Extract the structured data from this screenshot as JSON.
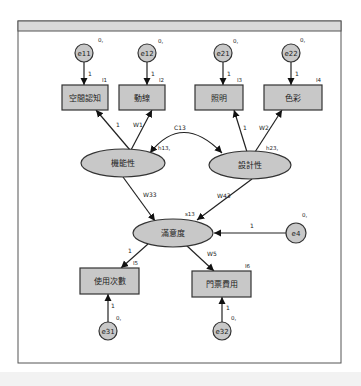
{
  "diagram": {
    "type": "structural-equation-model-path-diagram",
    "frame": {
      "x": 18,
      "y": 21,
      "w": 323,
      "h": 342,
      "header_h": 10,
      "header_color": "#d9d9d9"
    },
    "colors": {
      "node_fill": "#c8c8c8",
      "stroke": "#333333",
      "text": "#222222",
      "background": "#ffffff"
    },
    "observed": [
      {
        "id": "I1",
        "label": "空間認知",
        "tag": "I1",
        "x": 62,
        "y": 85,
        "w": 46,
        "h": 25
      },
      {
        "id": "I2",
        "label": "動線",
        "tag": "I2",
        "x": 119,
        "y": 85,
        "w": 46,
        "h": 25
      },
      {
        "id": "I3",
        "label": "照明",
        "tag": "I3",
        "x": 195,
        "y": 85,
        "w": 48,
        "h": 25
      },
      {
        "id": "I4",
        "label": "色彩",
        "tag": "I4",
        "x": 264,
        "y": 85,
        "w": 58,
        "h": 25
      },
      {
        "id": "I5",
        "label": "使用次數",
        "tag": "I5",
        "x": 80,
        "y": 268,
        "w": 59,
        "h": 26
      },
      {
        "id": "I6",
        "label": "門票費用",
        "tag": "I6",
        "x": 192,
        "y": 271,
        "w": 59,
        "h": 26
      }
    ],
    "latent": [
      {
        "id": "F1",
        "label": "機能性",
        "cx": 123,
        "cy": 163,
        "rx": 42,
        "ry": 14,
        "tag": "h13,",
        "tag_x": 158,
        "tag_y": 150
      },
      {
        "id": "F2",
        "label": "設計性",
        "cx": 250,
        "cy": 165,
        "rx": 41,
        "ry": 14,
        "tag": "h23,",
        "tag_x": 266,
        "tag_y": 150
      },
      {
        "id": "F3",
        "label": "滿意度",
        "cx": 173,
        "cy": 233,
        "rx": 40,
        "ry": 14,
        "tag": "s13",
        "tag_x": 185,
        "tag_y": 216
      }
    ],
    "errors": [
      {
        "id": "e11",
        "label": "e11",
        "cx": 84,
        "cy": 53,
        "r": 9,
        "var": "0,",
        "var_x": 98,
        "var_y": 42
      },
      {
        "id": "e12",
        "label": "e12",
        "cx": 147,
        "cy": 53,
        "r": 9,
        "var": "0,",
        "var_x": 158,
        "var_y": 43
      },
      {
        "id": "e21",
        "label": "e21",
        "cx": 223,
        "cy": 53,
        "r": 9,
        "var": "0,",
        "var_x": 233,
        "var_y": 43
      },
      {
        "id": "e22",
        "label": "e22",
        "cx": 291,
        "cy": 53,
        "r": 9,
        "var": "0,",
        "var_x": 300,
        "var_y": 42
      },
      {
        "id": "e4",
        "label": "e4",
        "cx": 296,
        "cy": 233,
        "r": 10,
        "var": "0,",
        "var_x": 302,
        "var_y": 217
      },
      {
        "id": "e31",
        "label": "e31",
        "cx": 108,
        "cy": 331,
        "r": 9,
        "var": "0,",
        "var_x": 116,
        "var_y": 320
      },
      {
        "id": "e32",
        "label": "e32",
        "cx": 222,
        "cy": 331,
        "r": 9,
        "var": "0,",
        "var_x": 231,
        "var_y": 320
      }
    ],
    "paths": [
      {
        "from": "e11",
        "to": "I1",
        "label": "1",
        "x1": 84,
        "y1": 62,
        "x2": 84,
        "y2": 85,
        "lx": 88,
        "ly": 76
      },
      {
        "from": "e12",
        "to": "I2",
        "label": "1",
        "x1": 147,
        "y1": 62,
        "x2": 147,
        "y2": 85,
        "lx": 151,
        "ly": 76
      },
      {
        "from": "e21",
        "to": "I3",
        "label": "1",
        "x1": 223,
        "y1": 62,
        "x2": 223,
        "y2": 85,
        "lx": 227,
        "ly": 76
      },
      {
        "from": "e22",
        "to": "I4",
        "label": "1",
        "x1": 291,
        "y1": 62,
        "x2": 291,
        "y2": 85,
        "lx": 295,
        "ly": 76
      },
      {
        "from": "F1",
        "to": "I1",
        "label": "1",
        "x1": 130,
        "y1": 150,
        "x2": 96,
        "y2": 110,
        "lx": 116,
        "ly": 127
      },
      {
        "from": "F1",
        "to": "I2",
        "label": "W1",
        "x1": 131,
        "y1": 150,
        "x2": 152,
        "y2": 110,
        "lx": 133,
        "ly": 127
      },
      {
        "from": "F2",
        "to": "I3",
        "label": "1",
        "x1": 247,
        "y1": 152,
        "x2": 234,
        "y2": 110,
        "lx": 243,
        "ly": 130
      },
      {
        "from": "F2",
        "to": "I4",
        "label": "W2",
        "x1": 255,
        "y1": 152,
        "x2": 282,
        "y2": 110,
        "lx": 259,
        "ly": 130
      },
      {
        "from": "F1",
        "to": "F3",
        "label": "W33",
        "x1": 123,
        "y1": 177,
        "x2": 155,
        "y2": 221,
        "lx": 143,
        "ly": 197
      },
      {
        "from": "F2",
        "to": "F3",
        "label": "W43",
        "x1": 252,
        "y1": 179,
        "x2": 197,
        "y2": 220,
        "lx": 217,
        "ly": 198
      },
      {
        "from": "e4",
        "to": "F3",
        "label": "1",
        "x1": 286,
        "y1": 233,
        "x2": 214,
        "y2": 233,
        "lx": 250,
        "ly": 228
      },
      {
        "from": "F3",
        "to": "I5",
        "label": "1",
        "x1": 148,
        "y1": 244,
        "x2": 121,
        "y2": 268,
        "lx": 128,
        "ly": 253
      },
      {
        "from": "F3",
        "to": "I6",
        "label": "W5",
        "x1": 186,
        "y1": 245,
        "x2": 214,
        "y2": 271,
        "lx": 207,
        "ly": 256
      },
      {
        "from": "e31",
        "to": "I5",
        "label": "1",
        "x1": 108,
        "y1": 322,
        "x2": 108,
        "y2": 294,
        "lx": 111,
        "ly": 308
      },
      {
        "from": "e32",
        "to": "I6",
        "label": "1",
        "x1": 222,
        "y1": 322,
        "x2": 222,
        "y2": 297,
        "lx": 226,
        "ly": 310
      }
    ],
    "covariances": [
      {
        "from": "F1",
        "to": "F2",
        "label": "C13",
        "d": "M150,153 Q182,112 222,153",
        "lx": 180,
        "ly": 130
      }
    ]
  }
}
